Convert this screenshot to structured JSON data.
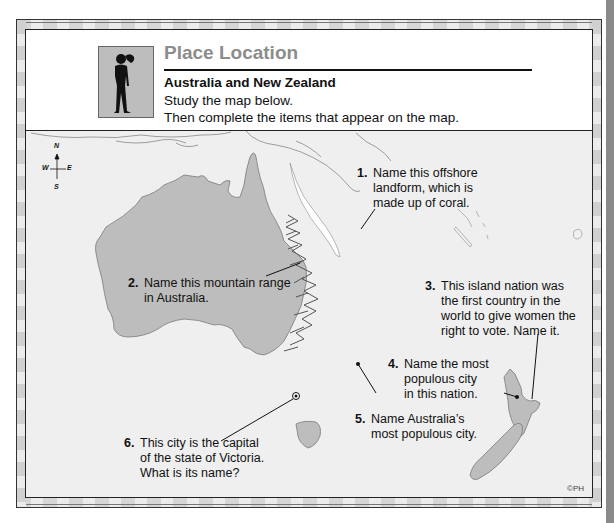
{
  "header": {
    "title": "Place Location",
    "subtitle": "Australia and New Zealand",
    "instructions": [
      "Study the map below.",
      "Then complete the items that appear on the map."
    ],
    "icon": "person-looking-icon"
  },
  "map": {
    "compass": {
      "n": "N",
      "s": "S",
      "e": "E",
      "w": "W"
    },
    "colors": {
      "land": "#bdbdbd",
      "sea": "#efefef",
      "outline": "#7a7a7a",
      "reef": "#ffffff"
    },
    "questions": [
      {
        "num": "1.",
        "lines": [
          "Name this offshore",
          "landform, which is",
          "made up of coral."
        ]
      },
      {
        "num": "2.",
        "lines": [
          "Name this mountain range",
          "in Australia."
        ]
      },
      {
        "num": "3.",
        "lines": [
          "This island nation was",
          "the first country in the",
          "world to give women the",
          "right to vote.  Name it."
        ]
      },
      {
        "num": "4.",
        "lines": [
          "Name the most",
          "populous city",
          "in this nation."
        ]
      },
      {
        "num": "5.",
        "lines": [
          "Name Australia’s",
          "most populous city."
        ]
      },
      {
        "num": "6.",
        "lines": [
          "This city is the capital",
          "of the state of Victoria.",
          "What is its name?"
        ]
      }
    ],
    "credit": "©PH"
  }
}
